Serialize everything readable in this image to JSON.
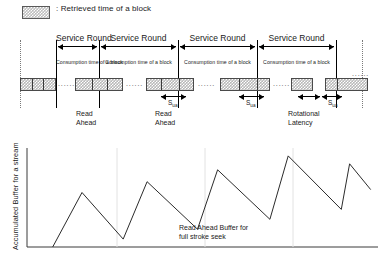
{
  "legend": {
    "swatch_icon": "hatched-square-icon",
    "text": ": Retrieved time of a block",
    "fill_color": "#bdbdbd"
  },
  "timeline": {
    "service_rounds": [
      {
        "label": "Service Round",
        "consumption_label": "Consumption time of a block"
      },
      {
        "label": "Service Round",
        "consumption_label": "Consumption time of a block"
      },
      {
        "label": "Service Round",
        "consumption_label": "Consumption time of a block"
      },
      {
        "label": "Service Round",
        "consumption_label": "Consumption time of a block"
      }
    ],
    "sua_labels": [
      "Sua",
      "Sua",
      "Sua"
    ],
    "sua_symbol": "S",
    "sua_subscript": "ua",
    "annotations": [
      {
        "name": "read-ahead-1",
        "line1": "Read",
        "line2": "Ahead"
      },
      {
        "name": "read-ahead-2",
        "line1": "Read",
        "line2": "Ahead"
      },
      {
        "name": "rotational-latency",
        "line1": "Rotational",
        "line2": "Latency"
      }
    ],
    "ellipsis": "......"
  },
  "chart_data": {
    "type": "line",
    "title": "",
    "xlabel": "",
    "ylabel": "Accumulated Buffer for a stream",
    "annotation": {
      "line1": "Read Ahead Buffer for",
      "line2": "full stroke seek"
    },
    "grid": false,
    "legend_position": "none",
    "xlim": [
      0,
      383
    ],
    "ylim": [
      0,
      100
    ],
    "series": [
      {
        "name": "Accumulated buffer",
        "points": [
          [
            28,
            0
          ],
          [
            60,
            55
          ],
          [
            105,
            8
          ],
          [
            131,
            66
          ],
          [
            186,
            18
          ],
          [
            208,
            78
          ],
          [
            265,
            28
          ],
          [
            285,
            92
          ],
          [
            343,
            38
          ],
          [
            352,
            84
          ],
          [
            375,
            58
          ]
        ]
      }
    ],
    "peaks": [
      55,
      66,
      78,
      92,
      84
    ],
    "troughs": [
      8,
      18,
      28,
      38
    ]
  }
}
